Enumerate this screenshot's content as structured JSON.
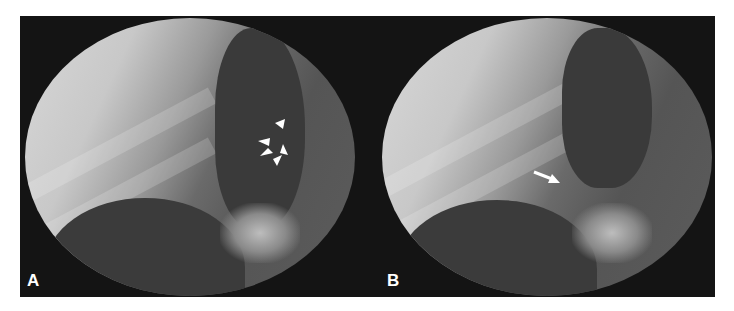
{
  "figure": {
    "panels": [
      {
        "label": "A",
        "annotation": "arrowheads",
        "arrowhead_count": 5
      },
      {
        "label": "B",
        "annotation": "arrow",
        "arrow_count": 1
      }
    ],
    "colors": {
      "background": "#111111",
      "annotation": "#ffffff"
    }
  }
}
